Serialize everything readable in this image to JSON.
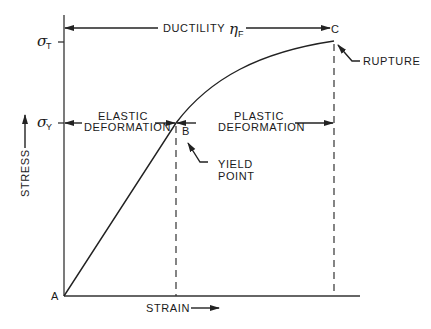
{
  "diagram": {
    "type": "stress-strain curve",
    "axes": {
      "x_label": "STRAIN",
      "y_label": "STRESS"
    },
    "y_ticks": {
      "sigma_T": {
        "symbol": "σ",
        "subscript": "T"
      },
      "sigma_Y": {
        "symbol": "σ",
        "subscript": "Y"
      }
    },
    "points": {
      "A": "A",
      "B": "B",
      "C": "C"
    },
    "annotations": {
      "ductility": "DUCTILITY",
      "ductility_symbol": "η",
      "ductility_subscript": "F",
      "elastic_line1": "ELASTIC",
      "elastic_line2": "DEFORMATION",
      "plastic_line1": "PLASTIC",
      "plastic_line2": "DEFORMATION",
      "yield_line1": "YIELD",
      "yield_line2": "POINT",
      "rupture": "RUPTURE"
    },
    "colors": {
      "ink": "#222222",
      "background": "#ffffff"
    }
  }
}
